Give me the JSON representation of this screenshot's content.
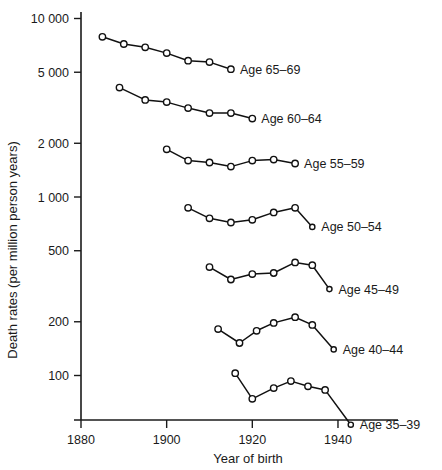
{
  "chart_data": {
    "type": "line",
    "title": "",
    "xlabel": "Year of birth",
    "ylabel": "Death rates (per million person years)",
    "yscale": "log",
    "ylim": [
      45,
      10000
    ],
    "xlim": [
      1878,
      1950
    ],
    "grid": false,
    "legend_position": "inline-right-of-series",
    "yticks": [
      100,
      200,
      500,
      1000,
      2000,
      5000,
      10000
    ],
    "ytick_labels": [
      "100",
      "200",
      "500",
      "1 000",
      "2 000",
      "5 000",
      "10 000"
    ],
    "xticks": [
      1880,
      1900,
      1920,
      1940
    ],
    "xtick_labels": [
      "1880",
      "1900",
      "1920",
      "1940"
    ],
    "marker": "open-circle",
    "series": [
      {
        "name": "Age 65–69",
        "label": "Age 65–69",
        "x": [
          1885,
          1890,
          1895,
          1900,
          1905,
          1910,
          1915
        ],
        "values": [
          7900,
          7200,
          6900,
          6400,
          5800,
          5700,
          5200
        ]
      },
      {
        "name": "Age 60–64",
        "label": "Age 60–64",
        "x": [
          1889,
          1895,
          1900,
          1905,
          1910,
          1915,
          1920
        ],
        "values": [
          4100,
          3500,
          3400,
          3150,
          2950,
          2950,
          2750
        ]
      },
      {
        "name": "Age 55–59",
        "label": "Age 55–59",
        "x": [
          1900,
          1905,
          1910,
          1915,
          1920,
          1925,
          1930
        ],
        "values": [
          1850,
          1600,
          1560,
          1480,
          1600,
          1620,
          1540
        ]
      },
      {
        "name": "Age 50–54",
        "label": "Age 50–54",
        "x": [
          1905,
          1910,
          1915,
          1920,
          1925,
          1930,
          1934
        ],
        "values": [
          870,
          760,
          720,
          745,
          820,
          870,
          680
        ]
      },
      {
        "name": "Age 45–49",
        "label": "Age 45–49",
        "x": [
          1910,
          1915,
          1920,
          1925,
          1930,
          1934,
          1938
        ],
        "values": [
          405,
          345,
          370,
          375,
          430,
          415,
          305
        ]
      },
      {
        "name": "Age 40–44",
        "label": "Age 40–44",
        "x": [
          1912,
          1917,
          1921,
          1925,
          1930,
          1934,
          1939
        ],
        "values": [
          182,
          152,
          178,
          197,
          212,
          192,
          140
        ]
      },
      {
        "name": "Age 35–39",
        "label": "Age 35–39",
        "x": [
          1916,
          1920,
          1925,
          1929,
          1933,
          1937,
          1943
        ],
        "values": [
          103,
          74,
          85,
          93,
          87,
          83,
          53
        ]
      }
    ]
  },
  "style": {
    "line_color": "#111111",
    "marker_fill": "#ffffff",
    "axis_color": "#1a1a1a",
    "background": "#ffffff"
  }
}
